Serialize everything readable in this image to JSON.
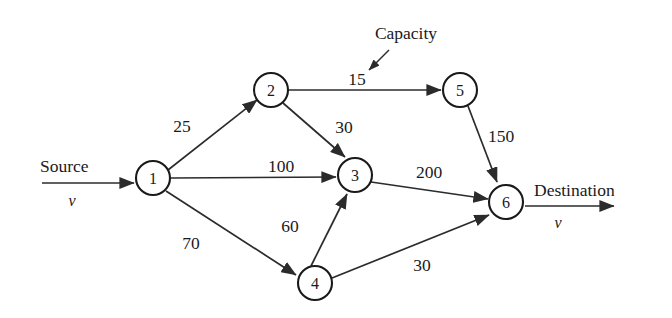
{
  "figure": {
    "type": "directed-network-flow-graph",
    "background_color": "#ffffff",
    "stroke_color": "#2b2b2b",
    "text_color": "#1a1a1a"
  },
  "nodes": [
    {
      "id": "1",
      "label": "1",
      "x": 153,
      "y": 178,
      "r": 17
    },
    {
      "id": "2",
      "label": "2",
      "x": 271,
      "y": 90,
      "r": 17
    },
    {
      "id": "3",
      "label": "3",
      "x": 355,
      "y": 175,
      "r": 17
    },
    {
      "id": "4",
      "label": "4",
      "x": 315,
      "y": 283,
      "r": 17
    },
    {
      "id": "5",
      "label": "5",
      "x": 460,
      "y": 90,
      "r": 17
    },
    {
      "id": "6",
      "label": "6",
      "x": 506,
      "y": 202,
      "r": 17
    }
  ],
  "edges": [
    {
      "from": "1",
      "to": "2",
      "capacity": "25",
      "label_x": 182,
      "label_y": 126
    },
    {
      "from": "2",
      "to": "5",
      "capacity": "15",
      "label_x": 357,
      "label_y": 79
    },
    {
      "from": "2",
      "to": "3",
      "capacity": "30",
      "label_x": 344,
      "label_y": 127
    },
    {
      "from": "1",
      "to": "3",
      "capacity": "100",
      "label_x": 281,
      "label_y": 166
    },
    {
      "from": "1",
      "to": "4",
      "capacity": "70",
      "label_x": 191,
      "label_y": 243
    },
    {
      "from": "4",
      "to": "3",
      "capacity": "60",
      "label_x": 290,
      "label_y": 226
    },
    {
      "from": "3",
      "to": "6",
      "capacity": "200",
      "label_x": 429,
      "label_y": 172
    },
    {
      "from": "5",
      "to": "6",
      "capacity": "150",
      "label_x": 501,
      "label_y": 136
    },
    {
      "from": "4",
      "to": "6",
      "capacity": "30",
      "label_x": 422,
      "label_y": 265
    }
  ],
  "terminals": {
    "source": {
      "label": "Source",
      "flow_variable": "v",
      "label_x": 40,
      "label_y": 166,
      "arrow_from_x": 42,
      "arrow_to_x": 134,
      "arrow_y": 183,
      "var_x": 72,
      "var_y": 200
    },
    "destination": {
      "label": "Destination",
      "flow_variable": "v",
      "label_x": 534,
      "label_y": 190,
      "arrow_from_x": 525,
      "arrow_to_x": 614,
      "arrow_y": 206,
      "var_x": 558,
      "var_y": 222
    }
  },
  "annotation": {
    "label": "Capacity",
    "label_x": 406,
    "label_y": 33,
    "pointer_from_x": 389,
    "pointer_from_y": 50,
    "pointer_to_x": 369,
    "pointer_to_y": 70
  }
}
